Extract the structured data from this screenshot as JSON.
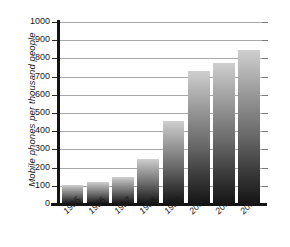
{
  "chart_data": {
    "type": "bar",
    "title": "",
    "xlabel": "",
    "ylabel": "Mobile phones per thousand people",
    "categories": [
      "1995",
      "1996",
      "1997",
      "1998",
      "1999",
      "2000",
      "2001",
      "2002"
    ],
    "values": [
      105,
      120,
      150,
      250,
      455,
      730,
      775,
      845
    ],
    "ylim": [
      0,
      1000
    ],
    "y_ticks": [
      "0",
      "100",
      "200",
      "300",
      "400",
      "500",
      "600",
      "700",
      "800",
      "900",
      "1000"
    ],
    "grid": true,
    "legend": "none",
    "bar_color_top": "#cfcfcf",
    "bar_color_bottom": "#141414",
    "gridline_color": "#a8a8a8",
    "axis_color": "#141414"
  }
}
